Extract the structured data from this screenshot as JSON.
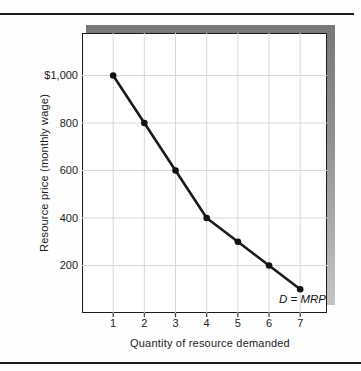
{
  "chart_data": {
    "type": "line",
    "x": [
      1,
      2,
      3,
      4,
      5,
      6,
      7
    ],
    "series": [
      {
        "name": "D = MRP",
        "values": [
          1000,
          800,
          600,
          400,
          300,
          200,
          100
        ]
      }
    ],
    "title": "",
    "xlabel": "Quantity of resource demanded",
    "ylabel": "Resource price (monthly wage)",
    "x_tick_labels": [
      "1",
      "2",
      "3",
      "4",
      "5",
      "6",
      "7"
    ],
    "y_ticks": [
      {
        "value": 1000,
        "label": "$1,000"
      },
      {
        "value": 800,
        "label": "800"
      },
      {
        "value": 600,
        "label": "600"
      },
      {
        "value": 400,
        "label": "400"
      },
      {
        "value": 200,
        "label": "200"
      }
    ],
    "xlim": [
      0,
      7.86
    ],
    "ylim": [
      0,
      1179
    ],
    "grid": true,
    "legend_position": "annotation-bottom-right",
    "colors": {
      "line": "#1b1b1b",
      "marker": "#111111",
      "grid": "#d8d8d8",
      "tick": "#3a3a3a",
      "frame": "#1c1c1c",
      "shadow_dark": "#787878",
      "shadow_light": "#c4c4c4"
    }
  }
}
